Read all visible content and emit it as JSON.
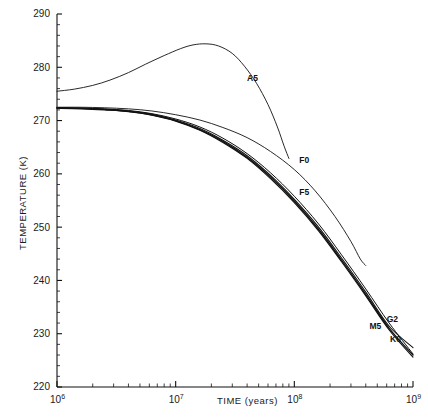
{
  "chart_data": {
    "type": "line",
    "title": "",
    "xlabel": "TIME (years)",
    "ylabel": "TEMPERATURE (K)",
    "xscale": "log",
    "yscale": "linear",
    "xlim": [
      1000000,
      1000000000
    ],
    "ylim": [
      220,
      290
    ],
    "grid": false,
    "legend_position": "inline-curve-labels",
    "xticks": [
      {
        "value": 1000000,
        "label": "10",
        "exponent": "6"
      },
      {
        "value": 10000000,
        "label": "10",
        "exponent": "7"
      },
      {
        "value": 100000000,
        "label": "10",
        "exponent": "8"
      },
      {
        "value": 1000000000,
        "label": "10",
        "exponent": "9"
      }
    ],
    "yticks": [
      {
        "value": 220,
        "label": "220"
      },
      {
        "value": 230,
        "label": "230"
      },
      {
        "value": 240,
        "label": "240"
      },
      {
        "value": 250,
        "label": "250"
      },
      {
        "value": 260,
        "label": "260"
      },
      {
        "value": 270,
        "label": "270"
      },
      {
        "value": 280,
        "label": "280"
      },
      {
        "value": 290,
        "label": "290"
      }
    ],
    "yminor_step": 2,
    "series": [
      {
        "name": "A5",
        "label": "A5",
        "label_at": {
          "x": 40000000,
          "y": 277.5
        },
        "width": 0.9,
        "points": [
          [
            1000000,
            275.5
          ],
          [
            1400000,
            275.9
          ],
          [
            2000000,
            276.6
          ],
          [
            2800000,
            277.6
          ],
          [
            4000000,
            279.0
          ],
          [
            5600000,
            280.6
          ],
          [
            8000000,
            282.2
          ],
          [
            11000000,
            283.5
          ],
          [
            14000000,
            284.2
          ],
          [
            18000000,
            284.4
          ],
          [
            23000000,
            284.0
          ],
          [
            30000000,
            282.6
          ],
          [
            38000000,
            280.2
          ],
          [
            48000000,
            277.0
          ],
          [
            60000000,
            273.0
          ],
          [
            72000000,
            268.8
          ],
          [
            82000000,
            265.2
          ],
          [
            90000000,
            262.9
          ]
        ]
      },
      {
        "name": "F0",
        "label": "F0",
        "label_at": {
          "x": 110000000,
          "y": 262.0
        },
        "width": 0.9,
        "points": [
          [
            1000000,
            272.5
          ],
          [
            1600000,
            272.5
          ],
          [
            2500000,
            272.4
          ],
          [
            4000000,
            272.2
          ],
          [
            6300000,
            271.8
          ],
          [
            10000000,
            271.1
          ],
          [
            16000000,
            270.1
          ],
          [
            25000000,
            268.7
          ],
          [
            40000000,
            266.8
          ],
          [
            63000000,
            264.2
          ],
          [
            100000000,
            260.8
          ],
          [
            150000000,
            256.8
          ],
          [
            220000000,
            252.0
          ],
          [
            300000000,
            247.3
          ],
          [
            360000000,
            244.0
          ],
          [
            400000000,
            242.8
          ]
        ]
      },
      {
        "name": "F5",
        "label": "F5",
        "label_at": {
          "x": 110000000,
          "y": 256.0
        },
        "width": 1.0,
        "points": [
          [
            1000000,
            272.4
          ],
          [
            1600000,
            272.3
          ],
          [
            2500000,
            272.2
          ],
          [
            4000000,
            271.9
          ],
          [
            6300000,
            271.3
          ],
          [
            10000000,
            270.3
          ],
          [
            16000000,
            268.8
          ],
          [
            25000000,
            266.7
          ],
          [
            40000000,
            263.8
          ],
          [
            63000000,
            260.2
          ],
          [
            100000000,
            255.8
          ],
          [
            160000000,
            250.6
          ],
          [
            250000000,
            244.8
          ],
          [
            400000000,
            238.4
          ],
          [
            630000000,
            232.0
          ],
          [
            1000000000,
            226.2
          ]
        ]
      },
      {
        "name": "G2",
        "label": "G2",
        "label_at": {
          "x": 600000000,
          "y": 232.2
        },
        "width": 1.1,
        "points": [
          [
            1000000,
            272.4
          ],
          [
            1600000,
            272.3
          ],
          [
            2500000,
            272.1
          ],
          [
            4000000,
            271.8
          ],
          [
            6300000,
            271.2
          ],
          [
            10000000,
            270.1
          ],
          [
            16000000,
            268.5
          ],
          [
            25000000,
            266.3
          ],
          [
            40000000,
            263.4
          ],
          [
            63000000,
            259.7
          ],
          [
            100000000,
            255.2
          ],
          [
            160000000,
            250.0
          ],
          [
            250000000,
            244.2
          ],
          [
            400000000,
            237.8
          ],
          [
            630000000,
            231.4
          ],
          [
            1000000000,
            227.4
          ]
        ]
      },
      {
        "name": "K0",
        "label": "K0",
        "label_at": {
          "x": 640000000,
          "y": 228.4
        },
        "width": 1.1,
        "points": [
          [
            1000000,
            272.3
          ],
          [
            1600000,
            272.2
          ],
          [
            2500000,
            272.0
          ],
          [
            4000000,
            271.7
          ],
          [
            6300000,
            271.0
          ],
          [
            10000000,
            269.9
          ],
          [
            16000000,
            268.2
          ],
          [
            25000000,
            265.9
          ],
          [
            40000000,
            262.9
          ],
          [
            63000000,
            259.1
          ],
          [
            100000000,
            254.6
          ],
          [
            160000000,
            249.3
          ],
          [
            250000000,
            243.5
          ],
          [
            400000000,
            237.1
          ],
          [
            630000000,
            230.7
          ],
          [
            1000000000,
            225.6
          ]
        ]
      },
      {
        "name": "M5",
        "label": "M5",
        "label_at": {
          "x": 430000000,
          "y": 230.8
        },
        "width": 1.4,
        "points": [
          [
            1000000,
            272.4
          ],
          [
            1600000,
            272.3
          ],
          [
            2500000,
            272.1
          ],
          [
            4000000,
            271.7
          ],
          [
            6300000,
            271.1
          ],
          [
            10000000,
            270.0
          ],
          [
            16000000,
            268.3
          ],
          [
            25000000,
            266.1
          ],
          [
            40000000,
            263.1
          ],
          [
            63000000,
            259.4
          ],
          [
            100000000,
            254.9
          ],
          [
            160000000,
            249.6
          ],
          [
            250000000,
            243.8
          ],
          [
            400000000,
            237.4
          ],
          [
            630000000,
            231.0
          ],
          [
            1000000000,
            226.0
          ]
        ]
      }
    ]
  }
}
